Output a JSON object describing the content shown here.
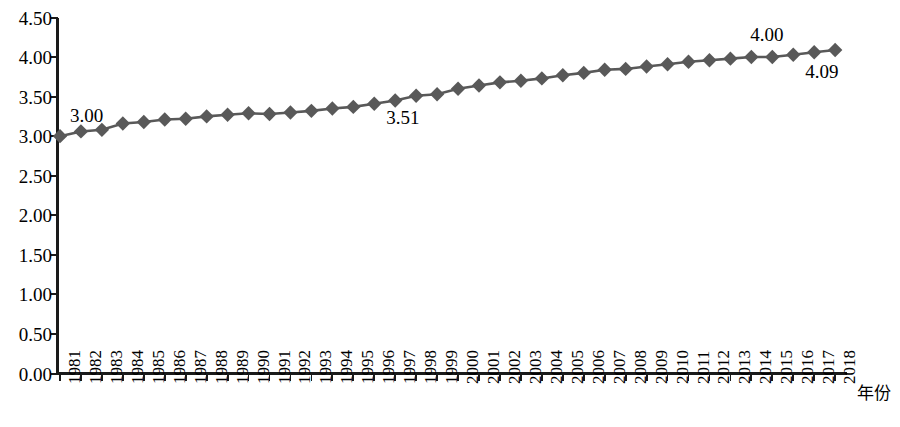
{
  "chart_data": {
    "type": "line",
    "title": "",
    "subtitle": "",
    "xlabel": "年份",
    "ylabel": "",
    "grid": false,
    "legend": false,
    "legend_position": "none",
    "marker": "diamond",
    "series_color": "#595959",
    "line_color": "#595959",
    "axis_color": "#1a1a1a",
    "background": "#ffffff",
    "ylim": [
      0.0,
      4.5
    ],
    "ytick_labels": [
      "0.00",
      "0.50",
      "1.00",
      "1.50",
      "2.00",
      "2.50",
      "3.00",
      "3.50",
      "4.00",
      "4.50"
    ],
    "ytick_values": [
      0.0,
      0.5,
      1.0,
      1.5,
      2.0,
      2.5,
      3.0,
      3.5,
      4.0,
      4.5
    ],
    "categories": [
      "1981",
      "1982",
      "1983",
      "1984",
      "1985",
      "1986",
      "1987",
      "1988",
      "1989",
      "1990",
      "1991",
      "1992",
      "1993",
      "1994",
      "1995",
      "1996",
      "1997",
      "1998",
      "1999",
      "2000",
      "2001",
      "2002",
      "2003",
      "2004",
      "2005",
      "2006",
      "2007",
      "2008",
      "2009",
      "2010",
      "2011",
      "2012",
      "2013",
      "2014",
      "2015",
      "2016",
      "2017",
      "2018"
    ],
    "values": [
      3.0,
      3.06,
      3.08,
      3.16,
      3.18,
      3.21,
      3.22,
      3.25,
      3.27,
      3.29,
      3.28,
      3.3,
      3.32,
      3.35,
      3.37,
      3.41,
      3.45,
      3.51,
      3.53,
      3.6,
      3.64,
      3.68,
      3.7,
      3.73,
      3.77,
      3.8,
      3.84,
      3.85,
      3.88,
      3.91,
      3.94,
      3.96,
      3.98,
      4.0,
      4.0,
      4.03,
      4.06,
      4.09
    ],
    "annotations": [
      {
        "text": "3.00",
        "category": "1981",
        "value": 3.0,
        "position": "above-right"
      },
      {
        "text": "3.51",
        "category": "1998",
        "value": 3.51,
        "position": "below-left"
      },
      {
        "text": "4.00",
        "category": "2015",
        "value": 4.0,
        "position": "above"
      },
      {
        "text": "4.09",
        "category": "2018",
        "value": 4.09,
        "position": "below-left"
      }
    ]
  },
  "axis": {
    "x_title": "年份"
  }
}
